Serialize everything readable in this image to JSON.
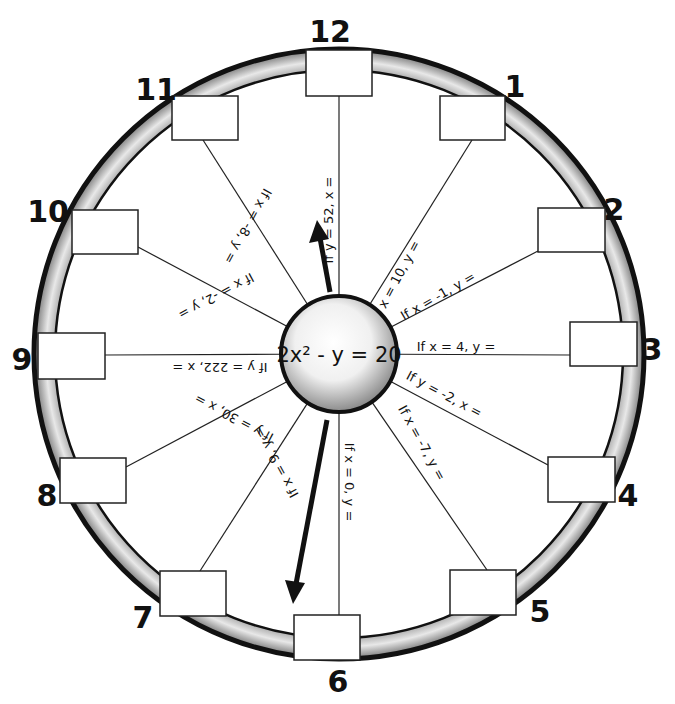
{
  "center": {
    "equation": "2x² - y = 20",
    "cx": 339,
    "cy": 354,
    "r": 58
  },
  "ring": {
    "outer_r": 305,
    "inner_r": 283,
    "fill": "#c8c8c8",
    "stroke": "#111111"
  },
  "arrows": [
    {
      "name": "arrow-up",
      "from": [
        330,
        290
      ],
      "to": [
        318,
        222
      ]
    },
    {
      "name": "arrow-down",
      "from": [
        327,
        420
      ],
      "to": [
        294,
        604
      ]
    }
  ],
  "spokes": [
    {
      "hour": "12",
      "label": "If y = 52, x =",
      "box": [
        306,
        50,
        66,
        46
      ],
      "num_pos": [
        330,
        42
      ],
      "end": [
        339,
        96
      ],
      "text_angle": -90,
      "text_pos": [
        333,
        220
      ]
    },
    {
      "hour": "1",
      "label": "If x = 10, y =",
      "box": [
        440,
        96,
        65,
        44
      ],
      "num_pos": [
        515,
        97
      ],
      "end": [
        472,
        140
      ],
      "text_angle": -62,
      "text_pos": [
        400,
        282
      ]
    },
    {
      "hour": "2",
      "label": "If x = -1, y =",
      "box": [
        538,
        208,
        67,
        44
      ],
      "num_pos": [
        614,
        220
      ],
      "end": [
        538,
        251
      ],
      "text_angle": -30,
      "text_pos": [
        440,
        300
      ]
    },
    {
      "hour": "3",
      "label": "If x = 4, y =",
      "box": [
        570,
        322,
        67,
        44
      ],
      "num_pos": [
        652,
        360
      ],
      "end": [
        570,
        355
      ],
      "text_angle": 0,
      "text_pos": [
        456,
        351
      ]
    },
    {
      "hour": "4",
      "label": "If y = -2, x =",
      "box": [
        548,
        457,
        67,
        45
      ],
      "num_pos": [
        628,
        506
      ],
      "end": [
        548,
        465
      ],
      "text_angle": 28,
      "text_pos": [
        442,
        398
      ]
    },
    {
      "hour": "5",
      "label": "If x = -7, y =",
      "box": [
        450,
        570,
        66,
        45
      ],
      "num_pos": [
        540,
        622
      ],
      "end": [
        487,
        570
      ],
      "text_angle": 61,
      "text_pos": [
        418,
        445
      ]
    },
    {
      "hour": "6",
      "label": "If x = 0, y =",
      "box": [
        294,
        615,
        66,
        45
      ],
      "num_pos": [
        338,
        692
      ],
      "end": [
        339,
        615
      ],
      "text_angle": 90,
      "text_pos": [
        345,
        482
      ]
    },
    {
      "hour": "7",
      "label": "If x = 9, y =",
      "box": [
        160,
        571,
        66,
        45
      ],
      "num_pos": [
        143,
        628
      ],
      "end": [
        200,
        571
      ],
      "text_angle": -119,
      "text_pos": [
        280,
        460
      ]
    },
    {
      "hour": "8",
      "label": "If y = 30, x =",
      "box": [
        60,
        458,
        66,
        45
      ],
      "num_pos": [
        47,
        506
      ],
      "end": [
        126,
        467
      ],
      "text_angle": -152,
      "text_pos": [
        236,
        414
      ]
    },
    {
      "hour": "9",
      "label": "If y = 222, x =",
      "box": [
        38,
        333,
        67,
        46
      ],
      "num_pos": [
        22,
        370
      ],
      "end": [
        105,
        355
      ],
      "text_angle": 180,
      "text_pos": [
        220,
        363
      ]
    },
    {
      "hour": "10",
      "label": "If x = -2, y =",
      "box": [
        72,
        210,
        66,
        44
      ],
      "num_pos": [
        48,
        222
      ],
      "end": [
        138,
        247
      ],
      "text_angle": 152,
      "text_pos": [
        214,
        292
      ]
    },
    {
      "hour": "11",
      "label": "If x = -8, y =",
      "box": [
        172,
        96,
        66,
        44
      ],
      "num_pos": [
        156,
        100
      ],
      "end": [
        203,
        140
      ],
      "text_angle": 119,
      "text_pos": [
        244,
        224
      ]
    }
  ]
}
